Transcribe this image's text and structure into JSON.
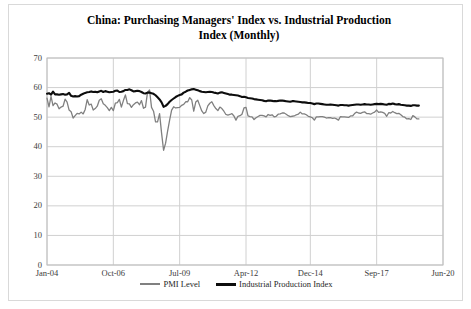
{
  "figure": {
    "title": "China: Purchasing Managers' Index vs. Industrial Production Index (Monthly)",
    "title_line1": "China: Purchasing Managers' Index vs. Industrial Production",
    "title_line2": "Index (Monthly)",
    "border_color": "#d9d9d9",
    "background": "#ffffff"
  },
  "legend": {
    "position": "bottom-center",
    "entries": [
      {
        "label": "PMI Level",
        "color": "#808080",
        "width": 2
      },
      {
        "label": "Industrial Production Index",
        "color": "#0d0d0d",
        "width": 3
      }
    ]
  },
  "axes": {
    "y_ticks": [
      "70",
      "60",
      "50",
      "40",
      "30",
      "20",
      "10",
      "0"
    ],
    "x_ticks": [
      "Jan-04",
      "Oct-06",
      "Jul-09",
      "Apr-12",
      "Dec-14",
      "Sep-17",
      "Jun-20"
    ],
    "gridline_color": "#d0d0d0",
    "frame_color": "#bfbfbf"
  },
  "chart_data": {
    "type": "line",
    "title": "China: Purchasing Managers' Index vs. Industrial Production Index (Monthly)",
    "xlabel": "",
    "ylabel": "",
    "ylim": [
      0,
      70
    ],
    "ytick_step": 10,
    "grid": true,
    "legend_position": "bottom-center",
    "x_tick_labels": [
      "Jan-04",
      "Oct-06",
      "Jul-09",
      "Apr-12",
      "Dec-14",
      "Sep-17",
      "Jun-20"
    ],
    "x_tick_months": [
      0,
      33,
      66,
      99,
      131,
      164,
      197
    ],
    "x_start": "Jan-04",
    "x_end_axis": "Jun-20",
    "x_data_end": "Jun-19",
    "n_points": 186,
    "series": [
      {
        "name": "PMI Level",
        "color": "#808080",
        "values": [
          56.4,
          53.5,
          57.0,
          53.9,
          54.8,
          54.4,
          52.8,
          53.4,
          53.7,
          56.1,
          55.1,
          52.4,
          51.8,
          49.7,
          50.5,
          51.3,
          51.1,
          51.7,
          51.1,
          52.6,
          55.9,
          54.1,
          54.4,
          52.4,
          52.9,
          53.7,
          55.7,
          56.2,
          54.5,
          54.0,
          53.2,
          52.2,
          53.3,
          52.2,
          54.7,
          54.9,
          56.0,
          53.4,
          55.6,
          57.5,
          54.6,
          54.5,
          53.3,
          54.2,
          54.8,
          55.1,
          54.2,
          55.6,
          53.0,
          53.4,
          58.4,
          59.2,
          53.3,
          52.0,
          48.4,
          48.4,
          51.2,
          44.6,
          38.8,
          41.2,
          45.3,
          49.0,
          52.4,
          53.5,
          53.1,
          53.2,
          53.3,
          54.0,
          54.3,
          55.2,
          55.2,
          56.6,
          55.8,
          52.0,
          55.1,
          55.7,
          53.9,
          52.1,
          51.2,
          51.7,
          53.8,
          54.7,
          55.2,
          53.9,
          52.9,
          52.2,
          53.4,
          52.9,
          52.0,
          50.9,
          50.7,
          50.9,
          51.2,
          50.4,
          49.0,
          50.3,
          50.5,
          51.0,
          53.1,
          53.3,
          50.4,
          50.2,
          50.1,
          49.2,
          49.8,
          50.2,
          50.6,
          50.6,
          50.4,
          50.1,
          50.9,
          50.6,
          50.8,
          50.1,
          50.3,
          51.0,
          51.1,
          51.4,
          51.4,
          51.0,
          50.5,
          50.2,
          50.3,
          50.4,
          50.8,
          51.0,
          51.7,
          51.1,
          51.1,
          50.8,
          50.3,
          50.1,
          49.8,
          49.0,
          50.1,
          50.1,
          50.2,
          50.2,
          50.0,
          49.7,
          49.8,
          49.8,
          49.6,
          49.7,
          49.4,
          49.0,
          50.2,
          50.1,
          50.1,
          50.0,
          49.9,
          50.4,
          50.4,
          51.2,
          51.7,
          51.4,
          51.3,
          51.6,
          51.8,
          51.2,
          51.2,
          51.0,
          51.4,
          51.7,
          52.4,
          51.6,
          51.8,
          51.6,
          51.3,
          50.3,
          51.5,
          51.4,
          51.9,
          51.5,
          51.2,
          51.3,
          50.8,
          50.2,
          50.0,
          49.4,
          49.5,
          49.2,
          50.5,
          50.1,
          49.4,
          49.4
        ]
      },
      {
        "name": "Industrial Production Index",
        "color": "#0d0d0d",
        "values": [
          57.9,
          58.1,
          57.6,
          58.6,
          57.7,
          57.7,
          57.6,
          57.7,
          57.8,
          57.6,
          57.7,
          58.2,
          57.2,
          57.0,
          57.1,
          57.0,
          57.1,
          57.6,
          57.9,
          58.2,
          58.4,
          58.5,
          58.7,
          58.5,
          58.6,
          58.4,
          58.7,
          58.9,
          58.5,
          58.8,
          58.6,
          58.4,
          58.5,
          58.6,
          58.9,
          59.0,
          58.5,
          58.6,
          58.8,
          59.2,
          59.2,
          59.4,
          59.1,
          58.7,
          58.8,
          58.9,
          58.8,
          58.5,
          58.1,
          58.0,
          58.3,
          58.3,
          58.1,
          57.9,
          57.4,
          56.7,
          56.0,
          55.0,
          53.5,
          53.8,
          54.4,
          55.2,
          55.8,
          56.3,
          56.8,
          57.2,
          57.5,
          57.7,
          58.3,
          58.6,
          59.0,
          59.2,
          59.4,
          59.5,
          59.3,
          59.1,
          58.8,
          58.6,
          58.5,
          58.4,
          58.5,
          58.6,
          58.5,
          58.3,
          58.2,
          58.0,
          58.3,
          58.4,
          58.2,
          58.0,
          57.8,
          57.6,
          57.6,
          57.5,
          57.4,
          57.3,
          57.1,
          56.8,
          56.9,
          56.7,
          56.5,
          56.4,
          56.3,
          56.1,
          56.0,
          55.9,
          55.8,
          55.7,
          55.5,
          55.4,
          55.6,
          55.6,
          55.5,
          55.4,
          55.4,
          55.5,
          55.6,
          55.6,
          55.5,
          55.4,
          55.3,
          55.2,
          55.4,
          55.4,
          55.3,
          55.2,
          55.1,
          55.0,
          55.0,
          54.9,
          54.8,
          54.8,
          54.6,
          54.4,
          54.6,
          54.6,
          54.5,
          54.4,
          54.3,
          54.2,
          54.2,
          54.3,
          54.2,
          54.1,
          54.0,
          53.9,
          54.1,
          54.1,
          54.0,
          54.0,
          53.9,
          54.0,
          54.1,
          54.2,
          54.3,
          54.3,
          54.2,
          54.3,
          54.4,
          54.3,
          54.3,
          54.2,
          54.3,
          54.4,
          54.5,
          54.4,
          54.5,
          54.4,
          54.3,
          54.2,
          54.5,
          54.4,
          54.6,
          54.4,
          54.3,
          54.4,
          54.2,
          54.1,
          54.0,
          53.9,
          53.9,
          53.8,
          54.0,
          54.0,
          53.9,
          53.9
        ]
      }
    ]
  }
}
